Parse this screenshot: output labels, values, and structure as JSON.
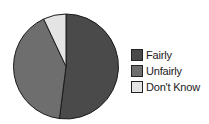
{
  "chart_data": {
    "type": "pie",
    "title": "",
    "categories": [
      "Fairly",
      "Unfairly",
      "Don't Know"
    ],
    "values": [
      52,
      41,
      7
    ],
    "colors": [
      "#4a4a4a",
      "#6e6e6e",
      "#e4e4e4"
    ],
    "start_angle_deg": 0,
    "direction": "clockwise",
    "legend_position": "right"
  },
  "legend": {
    "items": [
      {
        "label": "Fairly",
        "color": "#4a4a4a"
      },
      {
        "label": "Unfairly",
        "color": "#6e6e6e"
      },
      {
        "label": "Don't Know",
        "color": "#e4e4e4"
      }
    ]
  }
}
